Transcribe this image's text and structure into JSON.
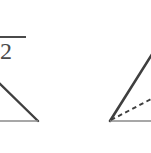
{
  "figure": {
    "background_color": "#ffffff",
    "stroke_color": "#3f3f3f",
    "base_stroke_color": "#6e6e6e",
    "dashed_stroke_color": "#3f3f3f",
    "label": {
      "name": "sqrt-two-label",
      "radicand": "2",
      "text": "√2",
      "note": "cropped square root of two label, partially off the left edge"
    },
    "left_shape": {
      "name": "left-right-triangle",
      "type": "triangle",
      "cropped_edge": "left",
      "apex": [
        -6,
        78
      ],
      "right_vertex": [
        38,
        121
      ],
      "left_vertex": [
        -6,
        121
      ],
      "hypotenuse_from": [
        -6,
        78
      ],
      "hypotenuse_to": [
        38,
        121
      ],
      "base_from": [
        -6,
        121
      ],
      "base_to": [
        38,
        121
      ]
    },
    "right_shape": {
      "name": "right-triangle-with-cevian",
      "type": "triangle",
      "cropped_edge": "right",
      "apex": [
        156,
        48
      ],
      "bottom_left_vertex": [
        110,
        121
      ],
      "bottom_right_vertex": [
        156,
        121
      ],
      "dashed_line_from": [
        110,
        121
      ],
      "dashed_line_to": [
        155,
        98
      ],
      "dashed_line_role": "cevian"
    },
    "dimensions": {
      "width": "151",
      "height": "153"
    }
  }
}
